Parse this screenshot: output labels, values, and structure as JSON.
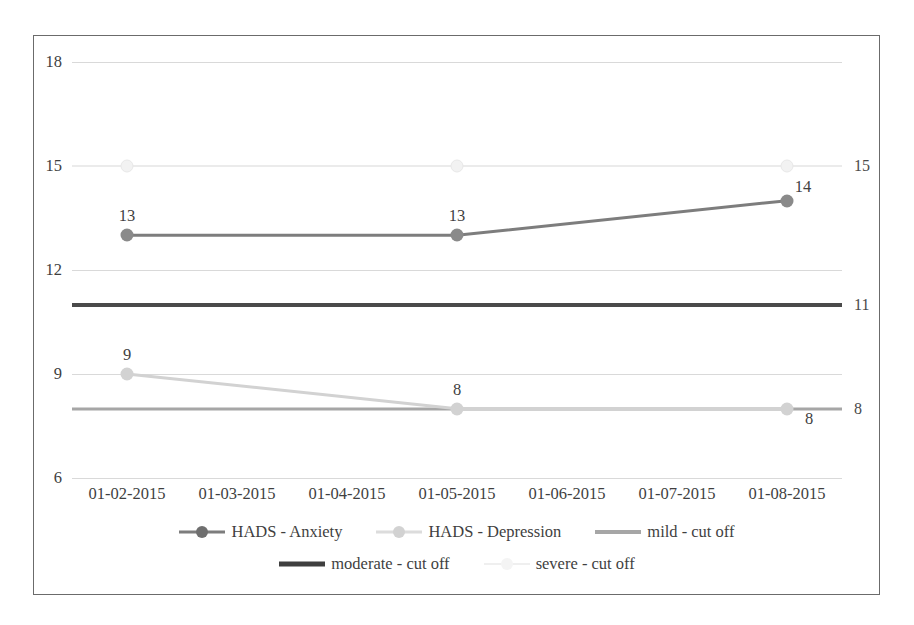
{
  "chart_data": {
    "type": "line",
    "title": "",
    "xlabel": "",
    "ylabel": "",
    "ylim": [
      6,
      18
    ],
    "yticks": [
      18,
      15,
      12,
      9,
      6
    ],
    "grid": true,
    "legend_position": "bottom",
    "categories": [
      "01-02-2015",
      "01-03-2015",
      "01-04-2015",
      "01-05-2015",
      "01-06-2015",
      "01-07-2015",
      "01-08-2015"
    ],
    "series": [
      {
        "name": "HADS - Anxiety",
        "color": "#7d7d7d",
        "marker": "circle",
        "x": [
          "01-02-2015",
          "01-05-2015",
          "01-08-2015"
        ],
        "values": [
          13,
          13,
          14
        ],
        "labels": [
          "13",
          "13",
          "14"
        ]
      },
      {
        "name": "HADS - Depression",
        "color": "#d2d2d2",
        "marker": "circle",
        "x": [
          "01-02-2015",
          "01-05-2015",
          "01-08-2015"
        ],
        "values": [
          9,
          8,
          8
        ],
        "labels": [
          "9",
          "8",
          "8"
        ]
      },
      {
        "name": "mild - cut off",
        "color": "#a6a6a6",
        "marker": "none",
        "type": "reference-line",
        "value": 8,
        "label": "8"
      },
      {
        "name": "moderate - cut off",
        "color": "#3f3f3f",
        "marker": "none",
        "type": "reference-line",
        "value": 11,
        "label": "11"
      },
      {
        "name": "severe - cut off",
        "color": "#efefef",
        "marker": "circle",
        "type": "reference-line",
        "value": 15,
        "label": "15"
      }
    ]
  },
  "axis": {
    "yticks": [
      {
        "label": "18",
        "value": 18
      },
      {
        "label": "15",
        "value": 15
      },
      {
        "label": "12",
        "value": 12
      },
      {
        "label": "9",
        "value": 9
      },
      {
        "label": "6",
        "value": 6
      }
    ],
    "xticks": [
      {
        "label": "01-02-2015"
      },
      {
        "label": "01-03-2015"
      },
      {
        "label": "01-04-2015"
      },
      {
        "label": "01-05-2015"
      },
      {
        "label": "01-06-2015"
      },
      {
        "label": "01-07-2015"
      },
      {
        "label": "01-08-2015"
      }
    ]
  },
  "legend": {
    "rows": [
      [
        {
          "name": "HADS - Anxiety",
          "key": "k-anxiety",
          "marker": true
        },
        {
          "name": "HADS - Depression",
          "key": "k-depression",
          "marker": true
        },
        {
          "name": "mild - cut off",
          "key": "k-mild",
          "marker": false
        }
      ],
      [
        {
          "name": "moderate - cut off",
          "key": "k-moderate",
          "marker": false
        },
        {
          "name": "severe - cut off",
          "key": "k-severe",
          "marker": true
        }
      ]
    ]
  },
  "annotations": {
    "mild_line_label": "8",
    "moderate_line_label": "11",
    "severe_line_label": "15"
  }
}
